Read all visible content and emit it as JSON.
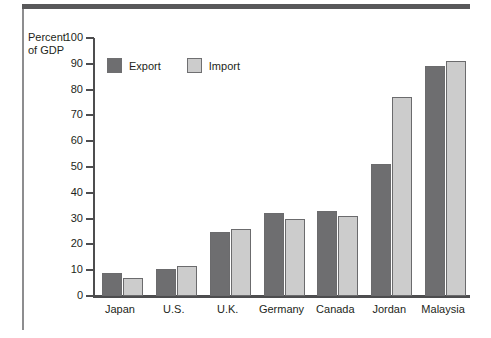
{
  "chart_data": {
    "type": "bar",
    "title": "",
    "subtitle": "",
    "xlabel": "",
    "ylabel": "Percent of GDP",
    "ylabel_line1": "Percent",
    "ylabel_line2": "of GDP",
    "ylim": [
      0,
      100
    ],
    "ytick_step": 10,
    "yticks": [
      100,
      90,
      80,
      70,
      60,
      50,
      40,
      30,
      20,
      10,
      0
    ],
    "ytick_labels": [
      "100",
      "90",
      "80",
      "70",
      "60",
      "50",
      "40",
      "30",
      "20",
      "10",
      "0"
    ],
    "grid": false,
    "legend_position": "top-left-inside",
    "categories": [
      "Japan",
      "U.S.",
      "U.K.",
      "Germany",
      "Canada",
      "Jordan",
      "Malaysia"
    ],
    "series": [
      {
        "name": "Export",
        "color": "#6e6e70",
        "values": [
          9,
          10.5,
          25,
          32,
          33,
          51,
          89
        ]
      },
      {
        "name": "Import",
        "color": "#cccccc",
        "values": [
          7,
          11.5,
          26,
          30,
          31,
          77,
          91
        ]
      }
    ]
  },
  "legend": {
    "items": [
      {
        "label": "Export",
        "color": "#6e6e70"
      },
      {
        "label": "Import",
        "color": "#cccccc"
      }
    ]
  },
  "colors": {
    "export": "#6e6e70",
    "import": "#cccccc",
    "axis": "#4d4d4f",
    "bar_stroke": "#6b6b6d",
    "text": "#231f20",
    "top_rule": "#58585a",
    "left_rule": "#8d8d8f",
    "background": "#ffffff"
  }
}
